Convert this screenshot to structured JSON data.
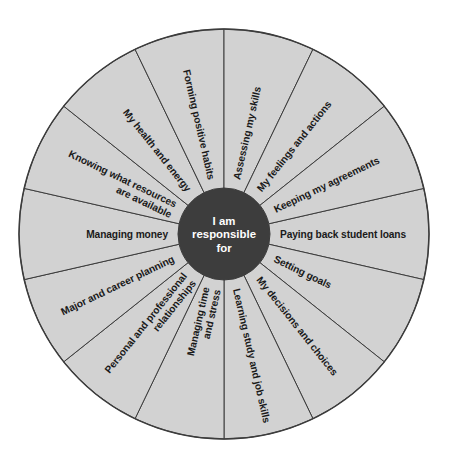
{
  "figure": {
    "name": "responsibility-wheel",
    "hub": {
      "lines": [
        "I am",
        "responsible",
        "for"
      ],
      "line1": "I am",
      "line2": "responsible",
      "line3": "for",
      "fill_color": "#3d3d3d",
      "text_color": "#ffffff"
    },
    "style": {
      "sector_fill": "#d2d2d2",
      "divider_color": "#3c3c3c",
      "background": "#ffffff"
    },
    "geometry": {
      "center_x": 224,
      "center_y": 234,
      "outer_radius": 205,
      "hub_radius": 46,
      "sector_count": 14,
      "sector_angle_deg": 25.714
    }
  },
  "chart_data": {
    "type": "pie",
    "title": "I am responsible for",
    "xlabel": "",
    "ylabel": "",
    "legend_position": "none",
    "grid": false,
    "categories": [
      "Paying back student loans",
      "Setting goals",
      "My decisions and choices",
      "Learning study and job skills",
      "Managing time and stress",
      "Personal and professional relationships",
      "Major and career planning",
      "Managing money",
      "Knowing what resources are available",
      "My health and energy",
      "Forming positive habits",
      "Assessing my skills",
      "My feelings and actions",
      "Keeping my agreements"
    ],
    "values": [
      1,
      1,
      1,
      1,
      1,
      1,
      1,
      1,
      1,
      1,
      1,
      1,
      1,
      1
    ],
    "slice_share_percent": 7.14
  },
  "sectors": [
    {
      "id": "paying-back-student-loans",
      "label": "Paying back student loans",
      "lines": [
        "Paying back student loans"
      ],
      "mid_angle_deg": 0
    },
    {
      "id": "setting-goals",
      "label": "Setting goals",
      "lines": [
        "Setting goals"
      ],
      "mid_angle_deg": 25.714
    },
    {
      "id": "my-decisions-and-choices",
      "label": "My decisions and choices",
      "lines": [
        "My decisions and choices"
      ],
      "mid_angle_deg": 51.429
    },
    {
      "id": "learning-study-and-job-skills",
      "label": "Learning study and job skills",
      "lines": [
        "Learning study and job skills"
      ],
      "mid_angle_deg": 77.143
    },
    {
      "id": "managing-time-and-stress",
      "label": "Managing time and stress",
      "lines": [
        "Managing time",
        "and stress"
      ],
      "mid_angle_deg": 102.857
    },
    {
      "id": "personal-and-professional-relationships",
      "label": "Personal and professional relationships",
      "lines": [
        "Personal and professional",
        "relationships"
      ],
      "mid_angle_deg": 128.571
    },
    {
      "id": "major-and-career-planning",
      "label": "Major and career planning",
      "lines": [
        "Major and career planning"
      ],
      "mid_angle_deg": 154.286
    },
    {
      "id": "managing-money",
      "label": "Managing money",
      "lines": [
        "Managing money"
      ],
      "mid_angle_deg": 180
    },
    {
      "id": "knowing-what-resources-are-available",
      "label": "Knowing what resources are available",
      "lines": [
        "Knowing what resources",
        "are available"
      ],
      "mid_angle_deg": 205.714
    },
    {
      "id": "my-health-and-energy",
      "label": "My health and energy",
      "lines": [
        "My health and energy"
      ],
      "mid_angle_deg": 231.429
    },
    {
      "id": "forming-positive-habits",
      "label": "Forming positive habits",
      "lines": [
        "Forming positive habits"
      ],
      "mid_angle_deg": 257.143
    },
    {
      "id": "assessing-my-skills",
      "label": "Assessing my skills",
      "lines": [
        "Assessing my skills"
      ],
      "mid_angle_deg": 282.857
    },
    {
      "id": "my-feelings-and-actions",
      "label": "My feelings and actions",
      "lines": [
        "My feelings and actions"
      ],
      "mid_angle_deg": 308.571
    },
    {
      "id": "keeping-my-agreements",
      "label": "Keeping my agreements",
      "lines": [
        "Keeping my agreements"
      ],
      "mid_angle_deg": 334.286
    }
  ]
}
